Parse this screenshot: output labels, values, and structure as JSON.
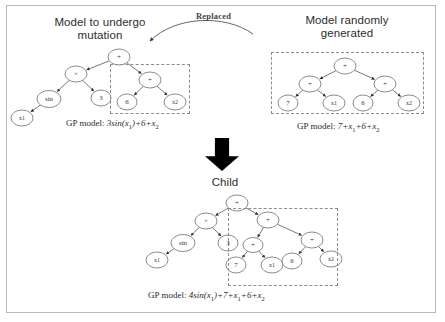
{
  "figure": {
    "caption_none": "",
    "panels": {
      "left_title": "Model to undergo\nmutation",
      "right_title": "Model randomly\ngenerated",
      "child_title": "Child",
      "replaced_label": "Replaced"
    },
    "gp_models": {
      "left_prefix": "GP model: ",
      "left_equation": "3sin(x1)+6+x2",
      "right_prefix": "GP model: ",
      "right_equation": "7+x1+6+x2",
      "child_prefix": "GP model: ",
      "child_equation": "4sin(x1)+7+x1+6+x2"
    },
    "colors": {
      "frame_border": "#b9b9b9",
      "node_stroke": "#6e6e6e",
      "edge_stroke": "#555555",
      "dashed_box": "#8c8c8c",
      "arrow_black": "#000000",
      "title_text": "#2d2d2d",
      "background": "#ffffff"
    },
    "trees": {
      "parent": {
        "name": "model-to-undergo-mutation-tree",
        "nodes": [
          {
            "id": "p-root",
            "label": "+",
            "x": 119,
            "y": 57,
            "rx": 11,
            "ry": 8,
            "fs": 7
          },
          {
            "id": "p-mul",
            "label": "×",
            "x": 76,
            "y": 74,
            "rx": 11,
            "ry": 8,
            "fs": 7
          },
          {
            "id": "p-sin",
            "label": "sin",
            "x": 49,
            "y": 99,
            "rx": 12,
            "ry": 8.5,
            "fs": 7
          },
          {
            "id": "p-x1",
            "label": "x1",
            "x": 22,
            "y": 118,
            "rx": 11,
            "ry": 8,
            "fs": 6
          },
          {
            "id": "p-3",
            "label": "3",
            "x": 101,
            "y": 98,
            "rx": 10,
            "ry": 8,
            "fs": 7
          },
          {
            "id": "p-plus",
            "label": "+",
            "x": 150,
            "y": 80,
            "rx": 11,
            "ry": 8,
            "fs": 7
          },
          {
            "id": "p-6",
            "label": "6",
            "x": 127,
            "y": 102,
            "rx": 10,
            "ry": 8,
            "fs": 7
          },
          {
            "id": "p-x2",
            "label": "x2",
            "x": 175,
            "y": 102,
            "rx": 11,
            "ry": 8,
            "fs": 6
          }
        ],
        "edges": [
          [
            "p-root",
            "p-mul"
          ],
          [
            "p-root",
            "p-plus"
          ],
          [
            "p-mul",
            "p-sin"
          ],
          [
            "p-mul",
            "p-3"
          ],
          [
            "p-sin",
            "p-x1"
          ],
          [
            "p-plus",
            "p-6"
          ],
          [
            "p-plus",
            "p-x2"
          ]
        ],
        "dashed_box": {
          "x": 110,
          "y": 64,
          "w": 80,
          "h": 50
        }
      },
      "random": {
        "name": "model-randomly-generated-tree",
        "nodes": [
          {
            "id": "r-root",
            "label": "+",
            "x": 345,
            "y": 66,
            "rx": 11,
            "ry": 8,
            "fs": 7
          },
          {
            "id": "r-plusL",
            "label": "+",
            "x": 310,
            "y": 84,
            "rx": 11,
            "ry": 8,
            "fs": 7
          },
          {
            "id": "r-7",
            "label": "7",
            "x": 288,
            "y": 103,
            "rx": 10,
            "ry": 8,
            "fs": 7
          },
          {
            "id": "r-x1",
            "label": "x1",
            "x": 334,
            "y": 103,
            "rx": 11,
            "ry": 8,
            "fs": 6
          },
          {
            "id": "r-plusR",
            "label": "+",
            "x": 385,
            "y": 84,
            "rx": 11,
            "ry": 8,
            "fs": 7
          },
          {
            "id": "r-6",
            "label": "6",
            "x": 363,
            "y": 103,
            "rx": 10,
            "ry": 8,
            "fs": 7
          },
          {
            "id": "r-x2",
            "label": "x2",
            "x": 409,
            "y": 103,
            "rx": 11,
            "ry": 8,
            "fs": 6
          }
        ],
        "edges": [
          [
            "r-root",
            "r-plusL"
          ],
          [
            "r-root",
            "r-plusR"
          ],
          [
            "r-plusL",
            "r-7"
          ],
          [
            "r-plusL",
            "r-x1"
          ],
          [
            "r-plusR",
            "r-6"
          ],
          [
            "r-plusR",
            "r-x2"
          ]
        ],
        "dashed_box": {
          "x": 271,
          "y": 52,
          "w": 153,
          "h": 62
        }
      },
      "child": {
        "name": "child-tree",
        "nodes": [
          {
            "id": "c-root",
            "label": "+",
            "x": 237,
            "y": 203,
            "rx": 11,
            "ry": 8,
            "fs": 7
          },
          {
            "id": "c-mul",
            "label": "×",
            "x": 206,
            "y": 221,
            "rx": 11,
            "ry": 8,
            "fs": 7
          },
          {
            "id": "c-sin",
            "label": "sin",
            "x": 183,
            "y": 243,
            "rx": 12,
            "ry": 8.5,
            "fs": 7
          },
          {
            "id": "c-x1a",
            "label": "x1",
            "x": 157,
            "y": 260,
            "rx": 11,
            "ry": 8,
            "fs": 6
          },
          {
            "id": "c-3",
            "label": "3",
            "x": 228,
            "y": 243,
            "rx": 10,
            "ry": 8,
            "fs": 7
          },
          {
            "id": "c-plus",
            "label": "+",
            "x": 268,
            "y": 220,
            "rx": 11,
            "ry": 8,
            "fs": 7
          },
          {
            "id": "c-plusL",
            "label": "+",
            "x": 253,
            "y": 245,
            "rx": 10,
            "ry": 7.5,
            "fs": 7
          },
          {
            "id": "c-7",
            "label": "7",
            "x": 236,
            "y": 265,
            "rx": 10,
            "ry": 8,
            "fs": 7
          },
          {
            "id": "c-x1b",
            "label": "x1",
            "x": 272,
            "y": 265,
            "rx": 11,
            "ry": 8,
            "fs": 6
          },
          {
            "id": "c-plusR",
            "label": "+",
            "x": 312,
            "y": 240,
            "rx": 11,
            "ry": 8,
            "fs": 7
          },
          {
            "id": "c-6",
            "label": "6",
            "x": 292,
            "y": 261,
            "rx": 10,
            "ry": 8,
            "fs": 7
          },
          {
            "id": "c-x2",
            "label": "x2",
            "x": 331,
            "y": 259,
            "rx": 11,
            "ry": 8,
            "fs": 6
          }
        ],
        "edges": [
          [
            "c-root",
            "c-mul"
          ],
          [
            "c-root",
            "c-plus"
          ],
          [
            "c-mul",
            "c-sin"
          ],
          [
            "c-mul",
            "c-3"
          ],
          [
            "c-sin",
            "c-x1a"
          ],
          [
            "c-plus",
            "c-plusL"
          ],
          [
            "c-plus",
            "c-plusR"
          ],
          [
            "c-plusL",
            "c-7"
          ],
          [
            "c-plusL",
            "c-x1b"
          ],
          [
            "c-plusR",
            "c-6"
          ],
          [
            "c-plusR",
            "c-x2"
          ]
        ],
        "dashed_box": {
          "x": 228,
          "y": 208,
          "w": 110,
          "h": 78
        }
      }
    },
    "replaced_arrow": {
      "name": "replaced-curved-arrow",
      "path": "M 253,34 C 225,14 175,16 150,41",
      "head": "150,41"
    },
    "down_arrow": {
      "name": "transform-down-arrow",
      "x": 205,
      "y": 138,
      "w": 34,
      "h": 33
    }
  }
}
